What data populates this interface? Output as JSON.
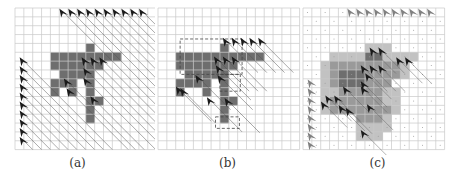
{
  "figure": {
    "grid_size": 16,
    "cell_px": 8.85,
    "colors": {
      "grid_line": "#c8c8c8",
      "shade_dark": "#6e6e6e",
      "shade_mid": "#9a9a9a",
      "shade_light": "#c2c2c2",
      "agent_dark": "#1a1a1a",
      "agent_gray": "#808080",
      "hatch": "#555555",
      "dashed": "#444444"
    },
    "panels": [
      {
        "id": "a",
        "caption": "(a)",
        "left": 15,
        "top": 8,
        "shaded": [
          [
            8,
            4
          ],
          [
            4,
            5
          ],
          [
            5,
            5
          ],
          [
            6,
            5
          ],
          [
            7,
            5
          ],
          [
            8,
            5
          ],
          [
            9,
            5
          ],
          [
            10,
            5
          ],
          [
            11,
            5
          ],
          [
            4,
            6
          ],
          [
            5,
            6
          ],
          [
            6,
            6
          ],
          [
            7,
            6
          ],
          [
            8,
            6
          ],
          [
            9,
            6
          ],
          [
            5,
            7
          ],
          [
            6,
            7
          ],
          [
            7,
            7
          ],
          [
            8,
            7
          ],
          [
            4,
            8
          ],
          [
            5,
            8
          ],
          [
            6,
            8
          ],
          [
            8,
            8
          ],
          [
            4,
            9
          ],
          [
            6,
            9
          ],
          [
            8,
            9
          ],
          [
            8,
            10
          ],
          [
            9,
            10
          ],
          [
            8,
            11
          ],
          [
            8,
            12
          ]
        ],
        "agents": [
          [
            5.5,
            0.5
          ],
          [
            6.5,
            0.5
          ],
          [
            7.5,
            0.5
          ],
          [
            8.5,
            0.5
          ],
          [
            9.5,
            0.5
          ],
          [
            10.5,
            0.5
          ],
          [
            11.5,
            0.5
          ],
          [
            12.5,
            0.5
          ],
          [
            13.5,
            0.5
          ],
          [
            14.5,
            0.5
          ],
          [
            1,
            6
          ],
          [
            1,
            7
          ],
          [
            1,
            8
          ],
          [
            1,
            9
          ],
          [
            1,
            10
          ],
          [
            1,
            11
          ],
          [
            1,
            12
          ],
          [
            1,
            13
          ],
          [
            1,
            14
          ],
          [
            1,
            15
          ],
          [
            8,
            6
          ],
          [
            9,
            6
          ],
          [
            10,
            6
          ],
          [
            8.2,
            7.2
          ],
          [
            8.2,
            8.3
          ],
          [
            6,
            8.4
          ],
          [
            6.3,
            9.5
          ],
          [
            9,
            10.4
          ]
        ],
        "hatch": true
      },
      {
        "id": "b",
        "caption": "(b)",
        "left": 158,
        "top": 8,
        "shaded": [
          [
            7,
            4
          ],
          [
            2,
            5
          ],
          [
            3,
            5
          ],
          [
            4,
            5
          ],
          [
            5,
            5
          ],
          [
            6,
            5
          ],
          [
            7,
            5
          ],
          [
            8,
            5
          ],
          [
            9,
            5
          ],
          [
            10,
            5
          ],
          [
            11,
            5
          ],
          [
            2,
            6
          ],
          [
            3,
            6
          ],
          [
            4,
            6
          ],
          [
            5,
            6
          ],
          [
            6,
            6
          ],
          [
            7,
            6
          ],
          [
            8,
            6
          ],
          [
            3,
            7
          ],
          [
            4,
            7
          ],
          [
            5,
            7
          ],
          [
            6,
            7
          ],
          [
            7,
            7
          ],
          [
            2,
            8
          ],
          [
            3,
            8
          ],
          [
            4,
            8
          ],
          [
            5,
            8
          ],
          [
            7,
            8
          ],
          [
            2,
            9
          ],
          [
            5,
            9
          ],
          [
            7,
            9
          ],
          [
            7,
            10
          ],
          [
            8,
            10
          ],
          [
            7,
            11
          ],
          [
            7,
            12
          ]
        ],
        "agents": [
          [
            7.8,
            3.8
          ],
          [
            8.8,
            3.8
          ],
          [
            9.8,
            3.8
          ],
          [
            10.8,
            3.8
          ],
          [
            11.8,
            3.8
          ],
          [
            6.8,
            5.9
          ],
          [
            7.8,
            5.9
          ],
          [
            8.8,
            5.9
          ],
          [
            7,
            6.9
          ],
          [
            7.2,
            8
          ],
          [
            4.7,
            8
          ],
          [
            2.5,
            9.3
          ],
          [
            3,
            9.5
          ],
          [
            6,
            10.5
          ],
          [
            8,
            10.6
          ]
        ],
        "dashed_regions": [
          [
            2.5,
            3.5,
            9.5,
            7.5
          ],
          [
            7,
            7.5,
            9.3,
            9.4
          ],
          [
            6.5,
            12.3,
            9.2,
            13.6
          ]
        ],
        "hatch": true
      },
      {
        "id": "c",
        "caption": "(c)",
        "left": 303,
        "top": 8,
        "shaded_light": [
          [
            7,
            4
          ],
          [
            8,
            4
          ],
          [
            9,
            4
          ],
          [
            3,
            5
          ],
          [
            4,
            5
          ],
          [
            5,
            5
          ],
          [
            6,
            5
          ],
          [
            7,
            5
          ],
          [
            8,
            5
          ],
          [
            9,
            5
          ],
          [
            10,
            5
          ],
          [
            11,
            5
          ],
          [
            12,
            5
          ],
          [
            2,
            6
          ],
          [
            2,
            7
          ],
          [
            2,
            8
          ],
          [
            11,
            6
          ],
          [
            11,
            7
          ],
          [
            3,
            9
          ],
          [
            2,
            9
          ],
          [
            2,
            10
          ],
          [
            2,
            11
          ],
          [
            9,
            9
          ],
          [
            10,
            9
          ],
          [
            9,
            10
          ],
          [
            10,
            10
          ],
          [
            10,
            11
          ],
          [
            9,
            12
          ],
          [
            9,
            13
          ],
          [
            6,
            13
          ],
          [
            7,
            13
          ],
          [
            8,
            13
          ],
          [
            6,
            14
          ],
          [
            7,
            14
          ],
          [
            8,
            14
          ]
        ],
        "shaded_mid": [
          [
            3,
            6
          ],
          [
            4,
            6
          ],
          [
            5,
            6
          ],
          [
            6,
            6
          ],
          [
            7,
            6
          ],
          [
            8,
            6
          ],
          [
            9,
            6
          ],
          [
            10,
            6
          ],
          [
            3,
            7
          ],
          [
            4,
            7
          ],
          [
            5,
            7
          ],
          [
            6,
            7
          ],
          [
            7,
            7
          ],
          [
            8,
            7
          ],
          [
            9,
            7
          ],
          [
            10,
            7
          ],
          [
            3,
            8
          ],
          [
            4,
            8
          ],
          [
            5,
            8
          ],
          [
            6,
            8
          ],
          [
            7,
            8
          ],
          [
            8,
            8
          ],
          [
            9,
            8
          ],
          [
            4,
            9
          ],
          [
            5,
            9
          ],
          [
            6,
            9
          ],
          [
            7,
            9
          ],
          [
            8,
            9
          ],
          [
            3,
            10
          ],
          [
            4,
            10
          ],
          [
            5,
            10
          ],
          [
            6,
            10
          ],
          [
            7,
            10
          ],
          [
            8,
            10
          ],
          [
            3,
            11
          ],
          [
            4,
            11
          ],
          [
            5,
            11
          ],
          [
            6,
            11
          ],
          [
            7,
            11
          ],
          [
            8,
            11
          ],
          [
            9,
            11
          ],
          [
            6,
            12
          ],
          [
            7,
            12
          ],
          [
            8,
            12
          ]
        ],
        "shaded_dark": [
          [
            4,
            7
          ],
          [
            5,
            7
          ],
          [
            6,
            7
          ],
          [
            4,
            8
          ],
          [
            5,
            8
          ],
          [
            6,
            8
          ],
          [
            7,
            5
          ],
          [
            8,
            5
          ]
        ],
        "agents_gray": [
          [
            5.5,
            0.5
          ],
          [
            6.5,
            0.5
          ],
          [
            7.5,
            0.5
          ],
          [
            8.5,
            0.5
          ],
          [
            9.5,
            0.5
          ],
          [
            10.5,
            0.5
          ],
          [
            11.5,
            0.5
          ],
          [
            12.5,
            0.5
          ],
          [
            13.5,
            0.5
          ],
          [
            14.5,
            0.5
          ],
          [
            1,
            8.5
          ],
          [
            1,
            9.5
          ],
          [
            1,
            10.5
          ],
          [
            1,
            11.5
          ],
          [
            1,
            12.5
          ],
          [
            1,
            13.5
          ],
          [
            1,
            14.5
          ],
          [
            1,
            15.5
          ]
        ],
        "agents": [
          [
            8,
            4.9
          ],
          [
            9,
            4.9
          ],
          [
            11,
            6
          ],
          [
            12,
            6
          ],
          [
            7,
            6.9
          ],
          [
            8,
            6.9
          ],
          [
            9,
            6.9
          ],
          [
            7.5,
            7.8
          ],
          [
            7,
            8.7
          ],
          [
            5,
            9.3
          ],
          [
            7,
            9.3
          ],
          [
            3,
            10.3
          ],
          [
            4,
            10.3
          ],
          [
            2.5,
            11
          ],
          [
            4.5,
            11.4
          ],
          [
            7.7,
            11.3
          ],
          [
            5.3,
            11.7
          ],
          [
            7,
            14.2
          ]
        ],
        "dots": true,
        "hatch": false
      }
    ]
  }
}
